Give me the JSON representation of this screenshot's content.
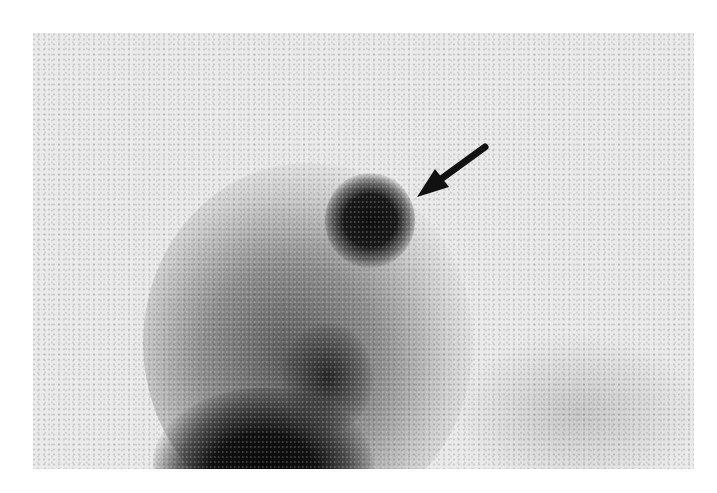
{
  "image": {
    "description": "Grayscale nuclear medicine scintigram with a dark focal hotspot indicated by a black arrow",
    "background_color": "#e9e9e9",
    "uptake_color": "#111111",
    "annotations": [
      {
        "type": "arrow",
        "pointing_to": "focal hotspot",
        "color": "#111111"
      }
    ]
  }
}
